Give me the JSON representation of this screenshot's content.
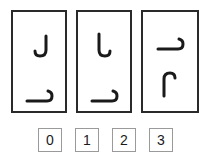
{
  "puzzle": {
    "cards": [
      {
        "index": 0,
        "top_glyph": "hook-open-left-J",
        "bottom_glyph": "hook-base-right-up"
      },
      {
        "index": 1,
        "top_glyph": "hook-open-right-L",
        "bottom_glyph": "hook-base-right-up"
      },
      {
        "index": 2,
        "top_glyph": "hook-base-right-down",
        "bottom_glyph": "hook-arch-left-down"
      }
    ],
    "answers": [
      {
        "label": "0"
      },
      {
        "label": "1"
      },
      {
        "label": "2"
      },
      {
        "label": "3"
      }
    ],
    "colors": {
      "stroke": "#1a1a1a",
      "card_border": "#2a2a2a",
      "button_border": "#9a9a9a",
      "background": "#ffffff"
    }
  }
}
